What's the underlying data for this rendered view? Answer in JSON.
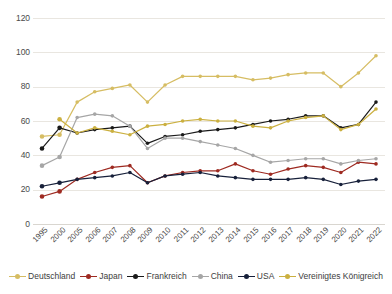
{
  "chart_data": {
    "type": "line",
    "title": "",
    "xlabel": "",
    "ylabel": "",
    "ylim": [
      0,
      120
    ],
    "yticks": [
      0,
      20,
      40,
      60,
      80,
      100,
      120
    ],
    "grid": true,
    "legend_position": "bottom",
    "categories": [
      "1995",
      "2000",
      "2005",
      "2006",
      "2007",
      "2008",
      "2009",
      "2010",
      "2011",
      "2012",
      "2013",
      "2014",
      "2015",
      "2016",
      "2017",
      "2018",
      "2019",
      "2020",
      "2021",
      "2022"
    ],
    "series": [
      {
        "name": "Deutschland",
        "color": "#d6bd63",
        "values": [
          51,
          52,
          71,
          77,
          79,
          81,
          71,
          81,
          86,
          86,
          86,
          86,
          84,
          85,
          87,
          88,
          88,
          80,
          88,
          98
        ]
      },
      {
        "name": "Japan",
        "color": "#9e2a21",
        "values": [
          16,
          19,
          26,
          30,
          33,
          34,
          24,
          28,
          30,
          31,
          31,
          35,
          31,
          29,
          32,
          34,
          33,
          30,
          36,
          35
        ]
      },
      {
        "name": "Frankreich",
        "color": "#1a1a1a",
        "values": [
          44,
          56,
          53,
          55,
          56,
          57,
          47,
          51,
          52,
          54,
          55,
          56,
          58,
          60,
          61,
          63,
          63,
          56,
          58,
          71
        ]
      },
      {
        "name": "China",
        "color": "#a6a6a6",
        "values": [
          34,
          39,
          62,
          64,
          63,
          57,
          44,
          50,
          50,
          48,
          46,
          44,
          40,
          36,
          37,
          38,
          38,
          35,
          37,
          38
        ]
      },
      {
        "name": "USA",
        "color": "#17203a",
        "values": [
          22,
          24,
          26,
          27,
          28,
          30,
          24,
          28,
          29,
          30,
          28,
          27,
          26,
          26,
          26,
          27,
          26,
          23,
          25,
          26
        ]
      },
      {
        "name": "Vereinigtes Königreich",
        "color": "#cbb040",
        "values": [
          null,
          61,
          53,
          56,
          54,
          52,
          57,
          58,
          60,
          61,
          60,
          60,
          57,
          56,
          60,
          62,
          63,
          55,
          58,
          67
        ]
      }
    ]
  },
  "legend": {
    "items": [
      {
        "label": "Deutschland",
        "color": "#d6bd63"
      },
      {
        "label": "Japan",
        "color": "#9e2a21"
      },
      {
        "label": "Frankreich",
        "color": "#1a1a1a"
      },
      {
        "label": "China",
        "color": "#a6a6a6"
      },
      {
        "label": "USA",
        "color": "#17203a"
      },
      {
        "label": "Vereinigtes Königreich",
        "color": "#cbb040"
      }
    ]
  }
}
